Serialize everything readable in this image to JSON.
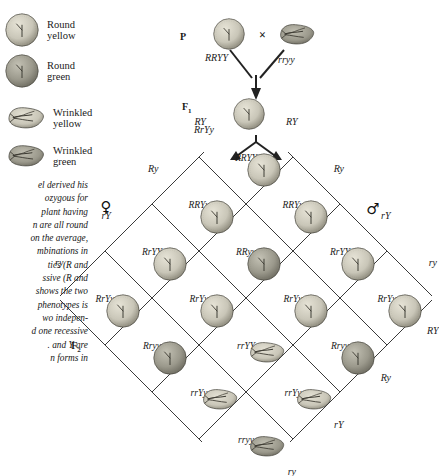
{
  "legend": {
    "items": [
      {
        "shape": "round",
        "color": "yellow",
        "label": "Round\nyellow"
      },
      {
        "shape": "round",
        "color": "green",
        "label": "Round\ngreen"
      },
      {
        "shape": "wrinkled",
        "color": "yellow",
        "label": "Wrinkled\nyellow"
      },
      {
        "shape": "wrinkled",
        "color": "green",
        "label": "Wrinkled\ngreen"
      }
    ]
  },
  "body_text": {
    "lines": [
      "el derived his",
      "ozygous for",
      " plant having",
      "n are all round",
      "on the average,",
      "mbinations in",
      "tics (R and",
      "ssive (R and",
      "shows the two",
      " phenotypes is",
      "wo indepen-",
      "d one recessive",
      ". and Y  are",
      "n forms in"
    ]
  },
  "cross": {
    "p_label": "P",
    "f1_label": "F",
    "f1_sub": "1",
    "x_symbol": "×",
    "parent_left_genotype": "RRYY",
    "parent_right_genotype": "rryy",
    "f1_genotype": "RrYy",
    "parent_left_shape": "round",
    "parent_left_color": "yellow",
    "parent_right_shape": "wrinkled",
    "parent_right_color": "green",
    "f1_shape": "round",
    "f1_color": "yellow"
  },
  "punnett": {
    "f2_label": "F",
    "f2_sub": "2",
    "female_symbol": "♀",
    "male_symbol": "♂",
    "female_gametes": [
      "RY",
      "Ry",
      "rY",
      "ry"
    ],
    "male_gametes": [
      "RY",
      "Ry",
      "rY",
      "ry"
    ],
    "cells": [
      [
        {
          "genotype": "RRYY",
          "shape": "round",
          "color": "yellow"
        },
        {
          "genotype": "RRYy",
          "shape": "round",
          "color": "yellow"
        },
        {
          "genotype": "RrYY",
          "shape": "round",
          "color": "yellow"
        },
        {
          "genotype": "RrYy",
          "shape": "round",
          "color": "yellow"
        }
      ],
      [
        {
          "genotype": "RRYy",
          "shape": "round",
          "color": "yellow"
        },
        {
          "genotype": "RRyy",
          "shape": "round",
          "color": "green"
        },
        {
          "genotype": "RrYy",
          "shape": "round",
          "color": "yellow"
        },
        {
          "genotype": "Rryy",
          "shape": "round",
          "color": "green"
        }
      ],
      [
        {
          "genotype": "RrYY",
          "shape": "round",
          "color": "yellow"
        },
        {
          "genotype": "RrYy",
          "shape": "round",
          "color": "yellow"
        },
        {
          "genotype": "rrYY",
          "shape": "wrinkled",
          "color": "yellow"
        },
        {
          "genotype": "rrYy",
          "shape": "wrinkled",
          "color": "yellow"
        }
      ],
      [
        {
          "genotype": "RrYy",
          "shape": "round",
          "color": "yellow"
        },
        {
          "genotype": "Rryy",
          "shape": "round",
          "color": "green"
        },
        {
          "genotype": "rrYy",
          "shape": "wrinkled",
          "color": "yellow"
        },
        {
          "genotype": "rryy",
          "shape": "wrinkled",
          "color": "green"
        }
      ]
    ]
  },
  "colors": {
    "ink": "#1a1a1a",
    "line": "#3a3a3a",
    "pea_yellow": "#c9c6b8",
    "pea_green": "#9b998c",
    "background": "#ffffff"
  }
}
